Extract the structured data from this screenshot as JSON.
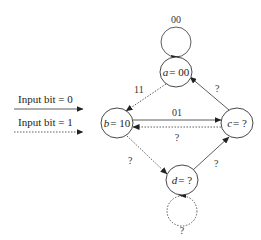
{
  "legend": {
    "items": [
      {
        "label": "Input bit = 0",
        "style": "solid"
      },
      {
        "label": "Input bit = 1",
        "style": "dashed"
      }
    ]
  },
  "nodes": {
    "a": {
      "var": "a",
      "value": "= 00"
    },
    "b": {
      "var": "b",
      "value": "= 10"
    },
    "c": {
      "var": "c",
      "value": "= ?"
    },
    "d": {
      "var": "d",
      "value": "= ?"
    }
  },
  "edges": {
    "a_self": {
      "label": "00",
      "style": "solid"
    },
    "a_to_b": {
      "label": "11",
      "style": "dashed"
    },
    "b_to_c": {
      "label": "01",
      "style": "solid"
    },
    "c_to_b": {
      "label": "?",
      "style": "dashed"
    },
    "c_to_a": {
      "label": "?",
      "style": "solid"
    },
    "b_to_d": {
      "label": "?",
      "style": "dashed"
    },
    "d_to_c": {
      "label": "?",
      "style": "solid"
    },
    "d_self": {
      "label": "?",
      "style": "dashed"
    }
  },
  "colors": {
    "stroke": "#333333",
    "background": "#ffffff"
  }
}
